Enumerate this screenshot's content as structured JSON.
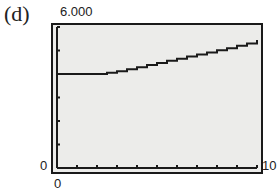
{
  "panel_label": "(d)",
  "axes": {
    "y_max_label": "6.000",
    "y_min_label": "0",
    "x_min_label": "0",
    "x_max_label": "10"
  },
  "colors": {
    "plot_background": "#ececea",
    "line": "#1a1a1a",
    "frame": "#1a1a1a"
  },
  "chart_data": {
    "type": "line",
    "title": "",
    "panel": "(d)",
    "xlabel": "",
    "ylabel": "",
    "xlim": [
      0,
      10
    ],
    "ylim": [
      0,
      6000
    ],
    "x_ticks": 10,
    "y_ticks": 6,
    "grid": false,
    "legend": null,
    "series": [
      {
        "name": "step function",
        "style": "staircase",
        "x": [
          0,
          1,
          2,
          2.5,
          3,
          3.5,
          4,
          4.5,
          5,
          5.5,
          6,
          6.5,
          7,
          7.5,
          8,
          8.5,
          9,
          9.5,
          10
        ],
        "y": [
          4000,
          4000,
          4000,
          4050,
          4120,
          4200,
          4290,
          4380,
          4470,
          4560,
          4650,
          4740,
          4830,
          4920,
          5010,
          5100,
          5200,
          5300,
          5450
        ]
      }
    ]
  }
}
